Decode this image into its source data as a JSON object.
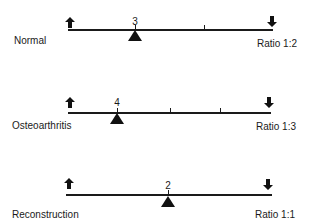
{
  "figure": {
    "type": "lever-balance-diagram",
    "rows": [
      {
        "condition": "Normal",
        "fulcrum_label": "3",
        "ratio": "Ratio 1:2",
        "left_arrow": "arrow-up-icon",
        "right_arrow": "arrow-down-icon",
        "ticks_count": 2
      },
      {
        "condition": "Osteoarthritis",
        "fulcrum_label": "4",
        "ratio": "Ratio 1:3",
        "left_arrow": "arrow-up-icon",
        "right_arrow": "arrow-down-icon",
        "ticks_count": 3
      },
      {
        "condition": "Reconstruction",
        "fulcrum_label": "2",
        "ratio": "Ratio 1:1",
        "left_arrow": "arrow-up-icon",
        "right_arrow": "arrow-down-icon",
        "ticks_count": 1
      }
    ]
  },
  "colors": {
    "ink": "#1a1a1a",
    "background": "#ffffff"
  }
}
